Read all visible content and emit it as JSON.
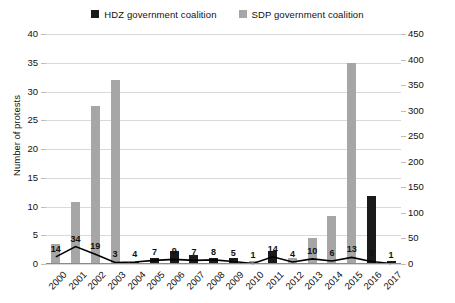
{
  "legend": {
    "items": [
      {
        "label": "HDZ government coalition",
        "color": "#1a1a1a",
        "key": "hdz"
      },
      {
        "label": "SDP government coalition",
        "color": "#a6a6a6",
        "key": "sdp"
      }
    ]
  },
  "chart_data": {
    "type": "bar",
    "title": "",
    "xlabel": "",
    "ylabel": "Number of protests",
    "y2label": "Protest duration in days * number of locations",
    "ylim": [
      0,
      40
    ],
    "y2lim": [
      0,
      450
    ],
    "yticks": [
      0,
      5,
      10,
      15,
      20,
      25,
      30,
      35,
      40
    ],
    "y2ticks": [
      0,
      50,
      100,
      150,
      200,
      250,
      300,
      350,
      400,
      450
    ],
    "grid": true,
    "legend_position": "top-center",
    "categories": [
      "2000",
      "2001",
      "2002",
      "2003",
      "2004",
      "2005",
      "2006",
      "2007",
      "2008",
      "2009",
      "2010",
      "2011",
      "2012",
      "2013",
      "2014",
      "2015",
      "2016",
      "2017"
    ],
    "series": [
      {
        "name": "HDZ government coalition",
        "type": "bar",
        "color": "#1a1a1a",
        "axis": "left",
        "values": [
          null,
          null,
          null,
          null,
          0.4,
          1.0,
          2.2,
          1.5,
          1.0,
          1.0,
          null,
          2.3,
          null,
          null,
          null,
          null,
          11.8,
          0.5
        ]
      },
      {
        "name": "SDP government coalition",
        "type": "bar",
        "color": "#a6a6a6",
        "axis": "left",
        "values": [
          3.5,
          10.8,
          27.5,
          32.0,
          null,
          null,
          null,
          null,
          null,
          null,
          0.5,
          null,
          1.1,
          4.5,
          8.3,
          35.0,
          null,
          null
        ]
      },
      {
        "name": "Protest duration in days * number of locations",
        "type": "line",
        "color": "#000000",
        "axis": "right",
        "values": [
          14,
          34,
          19,
          3,
          4,
          7,
          9,
          7,
          8,
          5,
          1,
          14,
          4,
          10,
          6,
          13,
          5,
          1
        ],
        "point_labels": [
          "14",
          "34",
          "19",
          "3",
          "4",
          "7",
          "9",
          "7",
          "8",
          "5",
          "1",
          "14",
          "4",
          "10",
          "6",
          "13",
          "5",
          "1"
        ]
      }
    ]
  }
}
